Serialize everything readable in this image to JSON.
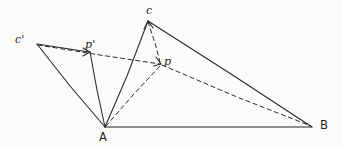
{
  "figure": {
    "kind": "hand-drawn-geometry-diagram",
    "background_color": "#fbfbfa",
    "ink_color": "#26262b",
    "width": 342,
    "height": 148,
    "points": [
      {
        "id": "C_prime",
        "label": "c'",
        "x": 37,
        "y": 44,
        "label_x": 15,
        "label_y": 33
      },
      {
        "id": "P_prime",
        "label": "p'",
        "x": 90,
        "y": 52,
        "label_x": 85,
        "label_y": 38
      },
      {
        "id": "C",
        "label": "c",
        "x": 148,
        "y": 21,
        "label_x": 146,
        "label_y": 4
      },
      {
        "id": "P",
        "label": "p",
        "x": 161,
        "y": 64,
        "label_x": 164,
        "label_y": 55
      },
      {
        "id": "A",
        "label": "A",
        "x": 105,
        "y": 127,
        "label_x": 99,
        "label_y": 130
      },
      {
        "id": "B",
        "label": "B",
        "x": 312,
        "y": 127,
        "label_x": 320,
        "label_y": 118
      }
    ],
    "solid_edges": [
      {
        "id": "edge-A-B",
        "from": "A",
        "to": "B"
      },
      {
        "id": "edge-A-C",
        "from": "A",
        "to": "C"
      },
      {
        "id": "edge-A-C-prime",
        "from": "A",
        "to": "C_prime"
      },
      {
        "id": "edge-A-P-prime",
        "from": "A",
        "to": "P_prime"
      },
      {
        "id": "edge-C-B",
        "from": "C",
        "to": "B"
      },
      {
        "id": "edge-C-prime-P-prime",
        "from": "C_prime",
        "to": "P_prime"
      }
    ],
    "dashed_edges": [
      {
        "id": "edge-C-P",
        "from": "C",
        "to": "P"
      },
      {
        "id": "edge-A-P",
        "from": "A",
        "to": "P"
      },
      {
        "id": "edge-C-prime-P",
        "from": "C_prime",
        "to": "P"
      },
      {
        "id": "edge-P-B",
        "from": "P",
        "to": "B"
      }
    ],
    "arrows": [
      {
        "id": "arrow-at-P-prime",
        "at": "P_prime",
        "direction": "right"
      },
      {
        "id": "arrow-at-C",
        "at": "C",
        "direction": "up"
      },
      {
        "id": "arrow-at-P",
        "at": "P",
        "direction": "down-right"
      }
    ]
  }
}
